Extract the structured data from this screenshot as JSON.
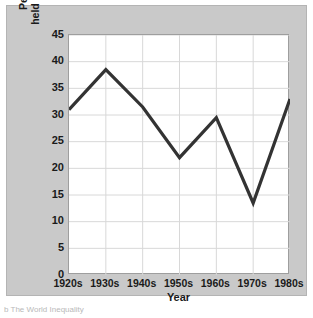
{
  "chart_data": {
    "type": "line",
    "title": "",
    "xlabel": "Year",
    "ylabel_line1": "Percentage of national wealth",
    "ylabel_line2": "held by wealthiest 1% of Americans",
    "categories": [
      "1920s",
      "1930s",
      "1940s",
      "1950s",
      "1960s",
      "1970s",
      "1980s"
    ],
    "values": [
      31,
      38.5,
      31.5,
      22,
      29.5,
      13.5,
      33
    ],
    "series": [
      {
        "name": "Percentage of national wealth held by wealthiest 1% of Americans",
        "values": [
          31,
          38.5,
          31.5,
          22,
          29.5,
          13.5,
          33
        ]
      }
    ],
    "ylim": [
      0,
      45
    ],
    "ytick_labels": [
      "0",
      "5",
      "10",
      "15",
      "20",
      "25",
      "30",
      "35",
      "40",
      "45"
    ],
    "ytick_values": [
      0,
      5,
      10,
      15,
      20,
      25,
      30,
      35,
      40,
      45
    ],
    "grid": true,
    "legend": "none",
    "line_color": "#333333",
    "plot_background": "#ffffff",
    "figure_background": "#c9c9c9",
    "grid_color": "#d8d8d8"
  },
  "caption": {
    "fragment": "b  The World Inequality"
  }
}
